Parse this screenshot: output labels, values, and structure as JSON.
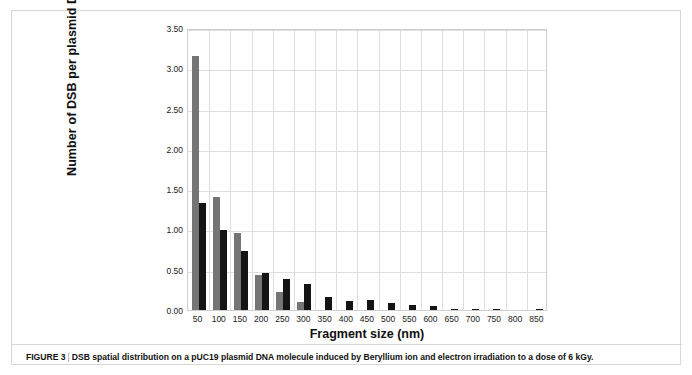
{
  "figure": {
    "caption_label": "FIGURE 3",
    "caption_separator": "|",
    "caption_text": "DSB spatial distribution on a pUC19 plasmid DNA molecule induced by Beryllium ion and electron irradiation to a dose of 6 kGy."
  },
  "colors": {
    "series_a": "#757575",
    "series_b": "#141414",
    "grid": "#dedede",
    "plot_border": "#cfcfcf",
    "frame": "#d8d8d8",
    "text": "#101010"
  },
  "chart_data": {
    "type": "bar",
    "title": "",
    "xlabel": "Fragment size (nm)",
    "ylabel": "Number of DSB per plasmid DNA molecule",
    "categories": [
      "50",
      "100",
      "150",
      "200",
      "250",
      "300",
      "350",
      "400",
      "450",
      "500",
      "550",
      "600",
      "650",
      "700",
      "750",
      "800",
      "850"
    ],
    "ylim": [
      0.0,
      3.5
    ],
    "yticks": [
      "0.00",
      "0.50",
      "1.00",
      "1.50",
      "2.00",
      "2.50",
      "3.00",
      "3.50"
    ],
    "ytick_values": [
      0.0,
      0.5,
      1.0,
      1.5,
      2.0,
      2.5,
      3.0,
      3.5
    ],
    "grid": true,
    "legend_position": "none",
    "series": [
      {
        "name": "Beryllium ion",
        "color": "#757575",
        "values": [
          3.15,
          1.4,
          0.95,
          0.44,
          0.22,
          0.1,
          0.0,
          0.0,
          0.0,
          0.0,
          0.0,
          0.0,
          0.0,
          0.0,
          0.0,
          0.0,
          0.0
        ]
      },
      {
        "name": "Electron",
        "color": "#141414",
        "values": [
          1.33,
          0.99,
          0.73,
          0.46,
          0.39,
          0.32,
          0.16,
          0.11,
          0.13,
          0.09,
          0.06,
          0.05,
          0.012,
          0.012,
          0.008,
          0.0,
          0.012
        ]
      }
    ]
  }
}
